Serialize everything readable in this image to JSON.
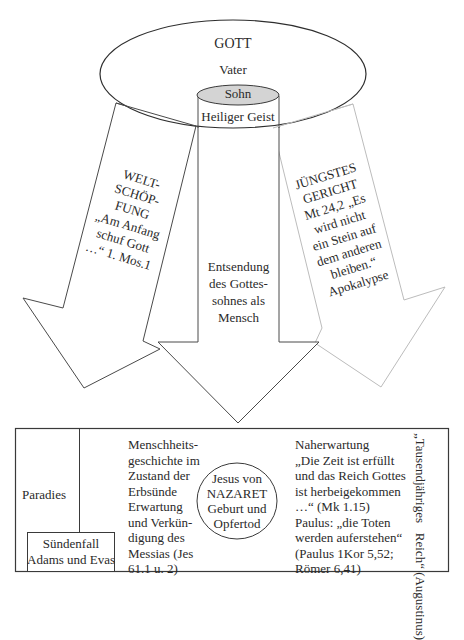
{
  "colors": {
    "line_dark": "#3a3a3a",
    "line_light": "#bcbcbc",
    "sohn_fill": "#d4d4d4",
    "background": "#ffffff"
  },
  "god": {
    "title": "GOTT",
    "vater": "Vater",
    "sohn": "Sohn",
    "geist": "Heiliger Geist"
  },
  "arrows": {
    "left": {
      "lines": [
        "WELT-",
        "SCHÖP-",
        "FUNG",
        "„Am Anfang",
        "schuf Gott",
        "…“ 1. Mos.1"
      ]
    },
    "center": {
      "lines": [
        "Entsendung",
        "des Gottes-",
        "sohnes als",
        "Mensch"
      ]
    },
    "right": {
      "lines": [
        "JÜNGSTES",
        "GERICHT",
        "Mt 24,2 „Es",
        "wird nicht",
        "ein Stein auf",
        "dem anderen",
        "bleiben.“",
        "Apokalypse"
      ]
    }
  },
  "timeline": {
    "paradies": "Paradies",
    "suendenfall": [
      "Sündenfall",
      "Adams und Evas"
    ],
    "menschheit": [
      "Menschheits-",
      "geschichte im",
      "Zustand der",
      "Erbsünde",
      "Erwartung",
      "und Verkün-",
      "digung des",
      "Messias (Jes",
      "61.1 u. 2)"
    ],
    "jesus": [
      "Jesus von",
      "NAZARET",
      "Geburt und",
      "Opfertod"
    ],
    "naherwartung": [
      "Naherwartung",
      "„Die Zeit ist erfüllt",
      "und das Reich Gottes",
      "ist herbeigekommen",
      "…“ (Mk 1.15)",
      "Paulus: „die Toten",
      "werden auferstehen“",
      "(Paulus 1Kor 5,52;",
      "Römer 6,41)"
    ],
    "reich": [
      "„Tausendjähriges   Reich“",
      "(Augustinus)"
    ]
  }
}
